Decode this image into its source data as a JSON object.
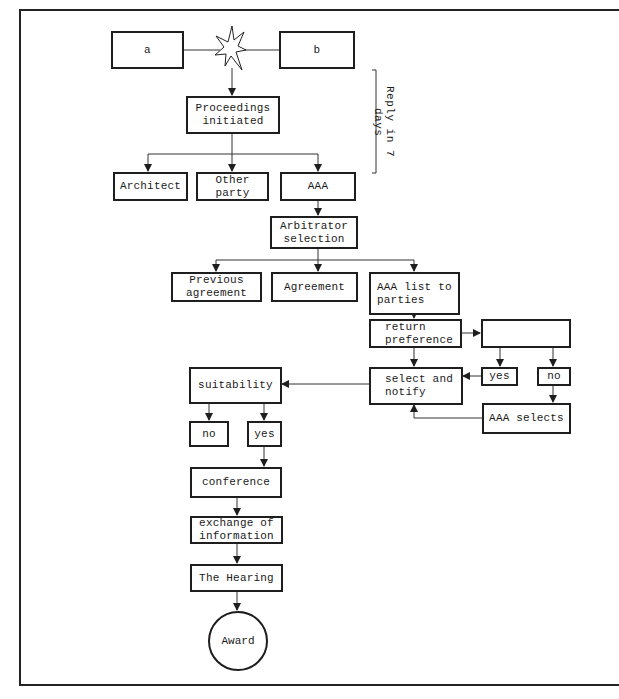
{
  "diagram": {
    "type": "flowchart",
    "nodes": {
      "a": "a",
      "b": "b",
      "proceedings": "Proceedings\ninitiated",
      "architect": "Architect",
      "other_party": "Other party",
      "aaa": "AAA",
      "arbitrator_selection": "Arbitrator\nselection",
      "previous_agreement": "Previous\nagreement",
      "agreement": "Agreement",
      "aaa_list": "AAA list to\nparties",
      "return_preference": "return\npreference",
      "empty_box": "",
      "select_notify": "select and\nnotify",
      "yes_right": "yes",
      "no_right": "no",
      "aaa_selects": "AAA selects",
      "suitability": "suitability",
      "no_left": "no",
      "yes_left": "yes",
      "conference": "conference",
      "exchange": "exchange of\ninformation",
      "hearing": "The Hearing",
      "award": "Award"
    },
    "annotation": {
      "reply": "Reply in 7 days"
    },
    "edges": [
      [
        "a",
        "conflict-star"
      ],
      [
        "b",
        "conflict-star"
      ],
      [
        "conflict-star",
        "proceedings"
      ],
      [
        "proceedings",
        "architect"
      ],
      [
        "proceedings",
        "other_party"
      ],
      [
        "proceedings",
        "aaa"
      ],
      [
        "aaa",
        "arbitrator_selection"
      ],
      [
        "arbitrator_selection",
        "previous_agreement"
      ],
      [
        "arbitrator_selection",
        "agreement"
      ],
      [
        "arbitrator_selection",
        "aaa_list"
      ],
      [
        "aaa_list",
        "return_preference"
      ],
      [
        "return_preference",
        "empty_box"
      ],
      [
        "return_preference",
        "select_notify"
      ],
      [
        "empty_box",
        "yes_right"
      ],
      [
        "empty_box",
        "no_right"
      ],
      [
        "yes_right",
        "select_notify"
      ],
      [
        "no_right",
        "aaa_selects"
      ],
      [
        "aaa_selects",
        "select_notify"
      ],
      [
        "select_notify",
        "suitability"
      ],
      [
        "suitability",
        "no_left"
      ],
      [
        "suitability",
        "yes_left"
      ],
      [
        "yes_left",
        "conference"
      ],
      [
        "conference",
        "exchange"
      ],
      [
        "exchange",
        "hearing"
      ],
      [
        "hearing",
        "award"
      ]
    ]
  }
}
